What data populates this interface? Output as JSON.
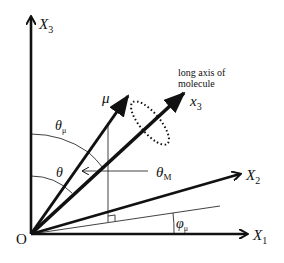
{
  "diagram": {
    "type": "coordinate-frame",
    "origin_label": "O",
    "axes": {
      "X1": {
        "label": "X",
        "sub": "1"
      },
      "X2": {
        "label": "X",
        "sub": "2"
      },
      "X3": {
        "label": "X",
        "sub": "3"
      }
    },
    "vectors": {
      "mu": {
        "label": "μ"
      },
      "x3": {
        "label": "x",
        "sub": "3"
      }
    },
    "annotation": {
      "line1": "long axis of",
      "line2": "molecule"
    },
    "angles": {
      "theta_mu": {
        "label": "θ",
        "sub": "μ"
      },
      "theta": {
        "label": "θ"
      },
      "theta_M": {
        "label": "θ",
        "sub": "M"
      },
      "phi_mu": {
        "label": "φ",
        "sub": "μ"
      }
    },
    "colors": {
      "ink": "#111111",
      "background": "#ffffff"
    }
  }
}
